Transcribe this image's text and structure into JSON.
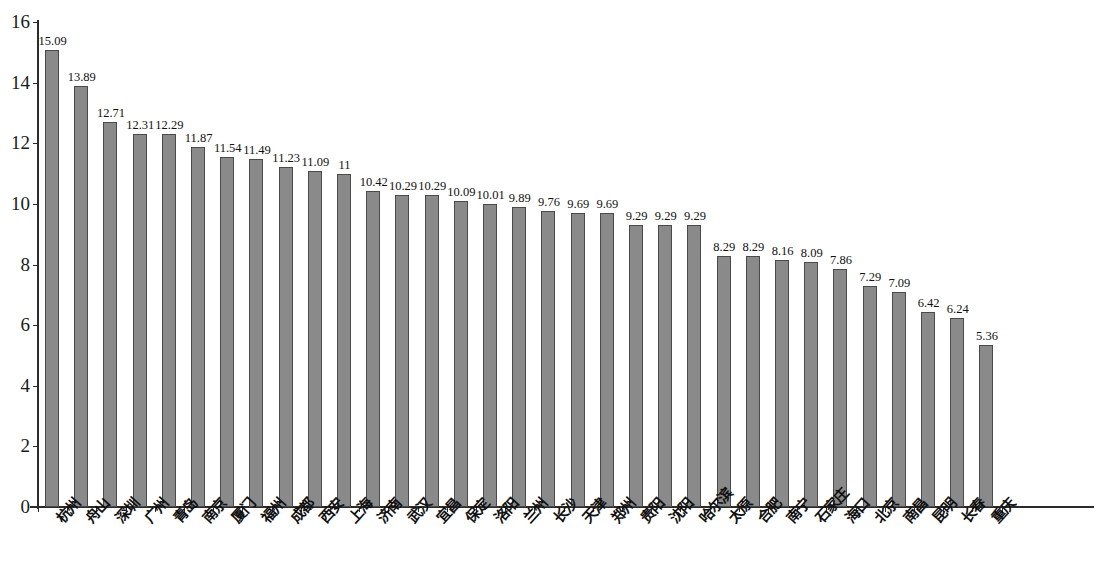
{
  "chart_data": {
    "type": "bar",
    "title": "",
    "subtitle": "",
    "xlabel": "",
    "ylabel": "",
    "ylim": [
      0,
      16
    ],
    "y_ticks": [
      0,
      2,
      4,
      6,
      8,
      10,
      12,
      14,
      16
    ],
    "y_tick_labels": [
      "0",
      "2",
      "4",
      "6",
      "8",
      "10",
      "12",
      "14",
      "16"
    ],
    "grid": false,
    "legend": null,
    "bar_color": "#8a8a8a",
    "bar_border_color": "#4a4a4a",
    "axis_color": "#2b2b2b",
    "categories": [
      "杭州",
      "舟山",
      "深圳",
      "广州",
      "青岛",
      "南京",
      "厦门",
      "福州",
      "成都",
      "西安",
      "上海",
      "济南",
      "武汉",
      "宜昌",
      "保定",
      "洛阳",
      "兰州",
      "长沙",
      "天津",
      "郑州",
      "贵阳",
      "沈阳",
      "哈尔滨",
      "太原",
      "合肥",
      "南宁",
      "石家庄",
      "海口",
      "北京",
      "南昌",
      "昆明",
      "长春",
      "重庆"
    ],
    "values": [
      15.09,
      13.89,
      12.71,
      12.31,
      12.29,
      11.87,
      11.54,
      11.49,
      11.23,
      11.09,
      11,
      10.42,
      10.29,
      10.29,
      10.09,
      10.01,
      9.89,
      9.76,
      9.69,
      9.69,
      9.29,
      9.29,
      9.29,
      8.29,
      8.29,
      8.16,
      8.09,
      7.86,
      7.29,
      7.09,
      6.42,
      6.24,
      5.36
    ],
    "value_labels": [
      "15.09",
      "13.89",
      "12.71",
      "12.31",
      "12.29",
      "11.87",
      "11.54",
      "11.49",
      "11.23",
      "11.09",
      "11",
      "10.42",
      "10.29",
      "10.29",
      "10.09",
      "10.01",
      "9.89",
      "9.76",
      "9.69",
      "9.69",
      "9.29",
      "9.29",
      "9.29",
      "8.29",
      "8.29",
      "8.16",
      "8.09",
      "7.86",
      "7.29",
      "7.09",
      "6.42",
      "6.24",
      "5.36"
    ]
  }
}
